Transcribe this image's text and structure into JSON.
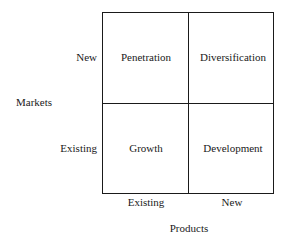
{
  "diagram": {
    "type": "2x2 matrix",
    "y_axis_title": "Markets",
    "x_axis_title": "Products",
    "row_labels": [
      "New",
      "Existing"
    ],
    "column_labels": [
      "Existing",
      "New"
    ],
    "cells": [
      {
        "row": "New",
        "column": "Existing",
        "label": "Penetration"
      },
      {
        "row": "New",
        "column": "New",
        "label": "Diversification"
      },
      {
        "row": "Existing",
        "column": "Existing",
        "label": "Growth"
      },
      {
        "row": "Existing",
        "column": "New",
        "label": "Development"
      }
    ]
  }
}
